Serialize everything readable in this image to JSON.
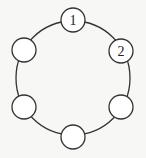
{
  "diagram": {
    "type": "ring-of-circles",
    "ring": {
      "cx": 73,
      "cy": 78,
      "r": 57,
      "stroke": "#333333"
    },
    "node_radius": 12,
    "node_fill": "#ffffff",
    "node_stroke": "#333333",
    "nodes": [
      {
        "id": "top",
        "cx": 73,
        "cy": 20,
        "label": "1"
      },
      {
        "id": "upper-right",
        "cx": 121,
        "cy": 51,
        "label": "2"
      },
      {
        "id": "lower-right",
        "cx": 121,
        "cy": 107,
        "label": ""
      },
      {
        "id": "bottom",
        "cx": 73,
        "cy": 137,
        "label": ""
      },
      {
        "id": "lower-left",
        "cx": 24,
        "cy": 107,
        "label": ""
      },
      {
        "id": "upper-left",
        "cx": 24,
        "cy": 50,
        "label": ""
      }
    ]
  }
}
